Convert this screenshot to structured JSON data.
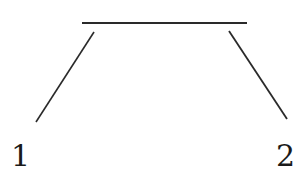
{
  "diagram": {
    "type": "line-drawing",
    "stroke_color": "#2a2a2a",
    "labels": [
      {
        "id": "label-1",
        "text": "1"
      },
      {
        "id": "label-2",
        "text": "2"
      }
    ],
    "segments": [
      {
        "id": "top-bar",
        "description": "horizontal line"
      },
      {
        "id": "left-leg",
        "description": "diagonal line toward label 1"
      },
      {
        "id": "right-leg",
        "description": "diagonal line toward label 2"
      }
    ]
  }
}
